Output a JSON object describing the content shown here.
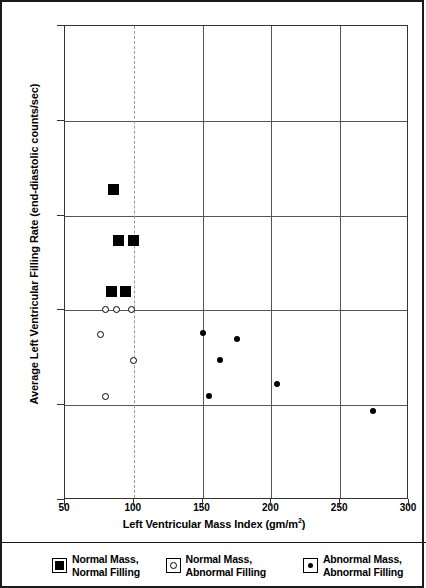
{
  "chart_data": {
    "type": "scatter",
    "title": "",
    "xlabel": "Left Ventricular Mass Index (gm/m²)",
    "ylabel": "Average Left Ventricular Filling Rate (end-diastolic counts/sec)",
    "xlim": [
      50,
      300
    ],
    "ylim": [
      1.0,
      3.5
    ],
    "xticks": [
      50,
      100,
      150,
      200,
      250,
      300
    ],
    "xtick_labels": [
      "50",
      "100",
      "150",
      "200",
      "250",
      "300"
    ],
    "yticks": [
      1.0,
      1.5,
      2.0,
      2.5,
      3.0,
      3.5
    ],
    "ytick_labels": [
      "1.0",
      "1.5",
      "2.0",
      "2.5",
      "3.0",
      "3.5"
    ],
    "grid": true,
    "legend_position": "bottom",
    "series": [
      {
        "name": "Normal Mass, Normal Filling",
        "marker": "filled-square",
        "color": "#000000",
        "points": [
          {
            "x": 85,
            "y": 2.64
          },
          {
            "x": 89,
            "y": 2.37
          },
          {
            "x": 100,
            "y": 2.37
          },
          {
            "x": 84,
            "y": 2.1
          },
          {
            "x": 94,
            "y": 2.1
          }
        ]
      },
      {
        "name": "Normal Mass, Abnormal Filling",
        "marker": "open-circle",
        "color": "#000000",
        "points": [
          {
            "x": 80,
            "y": 2.0
          },
          {
            "x": 88,
            "y": 2.0
          },
          {
            "x": 99,
            "y": 2.0
          },
          {
            "x": 76,
            "y": 1.87
          },
          {
            "x": 100,
            "y": 1.73
          },
          {
            "x": 80,
            "y": 1.54
          }
        ]
      },
      {
        "name": "Abnormal Mass, Abnormal Filling",
        "marker": "filled-circle",
        "color": "#000000",
        "points": [
          {
            "x": 150,
            "y": 1.88
          },
          {
            "x": 175,
            "y": 1.85
          },
          {
            "x": 163,
            "y": 1.74
          },
          {
            "x": 155,
            "y": 1.55
          },
          {
            "x": 204,
            "y": 1.61
          },
          {
            "x": 274,
            "y": 1.47
          }
        ]
      }
    ]
  },
  "axes": {
    "y_title": "Average Left Ventricular Filling Rate (end-diastolic counts/sec)",
    "x_title_main": "Left Ventricular Mass Index (gm/m",
    "x_title_sup": "2",
    "x_title_end": ")"
  },
  "legend": {
    "items": [
      {
        "marker": "filled-square-swatch",
        "line1": "Normal Mass,",
        "line2": "Normal Filling"
      },
      {
        "marker": "open-circle-swatch",
        "line1": "Normal Mass,",
        "line2": "Abnormal Filling"
      },
      {
        "marker": "filled-dot-swatch",
        "line1": "Abnormal Mass,",
        "line2": "Abnormal Filling"
      }
    ]
  }
}
